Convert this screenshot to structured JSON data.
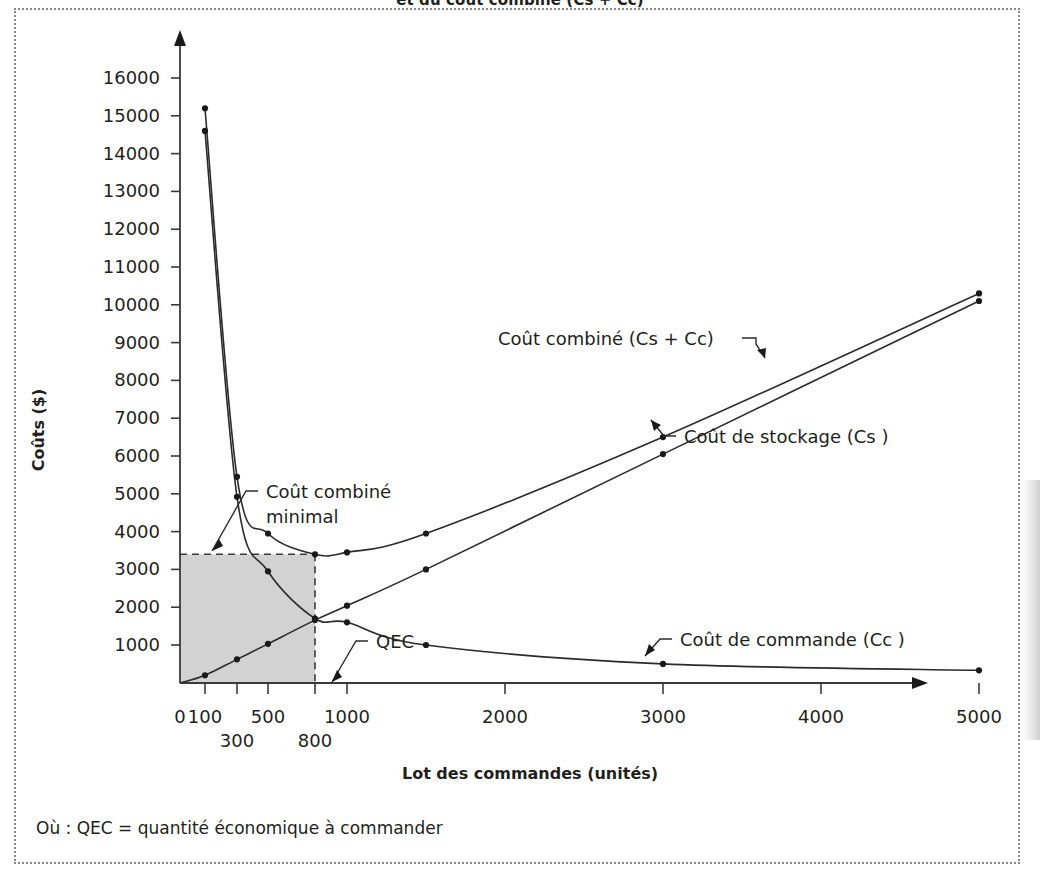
{
  "figure": {
    "title": "et du coût combiné (Cs + Cc)",
    "footnote": "Où : QEC = quantité économique à commander"
  },
  "chart_data": {
    "type": "line",
    "title": "et du coût combiné (Cs + Cc)",
    "xlabel": "Lot des commandes (unités)",
    "ylabel": "Coûts ($)",
    "xlim": [
      0,
      5300
    ],
    "ylim": [
      0,
      16800
    ],
    "grid": false,
    "legend_position": "inline-annotations",
    "xticks": [
      0,
      100,
      300,
      500,
      800,
      1000,
      2000,
      3000,
      4000,
      5000
    ],
    "xtick_labels": [
      "0",
      "100",
      "300",
      "500",
      "800",
      "1000",
      "2000",
      "3000",
      "4000",
      "5000"
    ],
    "xtick_labels_row2": [
      "300",
      "800"
    ],
    "yticks": [
      1000,
      2000,
      3000,
      4000,
      5000,
      6000,
      7000,
      8000,
      9000,
      10000,
      11000,
      12000,
      13000,
      14000,
      15000,
      16000
    ],
    "ytick_labels": [
      "1000",
      "2000",
      "3000",
      "4000",
      "5000",
      "6000",
      "7000",
      "8000",
      "9000",
      "10000",
      "11000",
      "12000",
      "13000",
      "14000",
      "15000",
      "16000"
    ],
    "x": [
      100,
      300,
      500,
      800,
      1000,
      1500,
      3000,
      5000
    ],
    "series": [
      {
        "name": "Coût combiné (Cs + Cc)",
        "values": [
          15200,
          5450,
          3950,
          3400,
          3450,
          3950,
          6500,
          10300
        ]
      },
      {
        "name": "Coût de stockage (Cs )",
        "values": [
          200,
          620,
          1030,
          1660,
          2040,
          3000,
          6050,
          10100
        ]
      },
      {
        "name": "Coût de commande (Cc )",
        "values": [
          14600,
          4920,
          2950,
          1700,
          1600,
          1000,
          500,
          330
        ]
      }
    ],
    "annotations": [
      {
        "key": "combined_min",
        "label_line1": "Coût combiné",
        "label_line2": "minimal",
        "value": 3400
      },
      {
        "key": "qec",
        "label": "QEC",
        "value": 800
      },
      {
        "key": "series_combined",
        "label": "Coût combiné (Cs + Cc)"
      },
      {
        "key": "series_storage",
        "label": "Coût de stockage (Cs )"
      },
      {
        "key": "series_ordering",
        "label": "Coût de commande (Cc )"
      }
    ],
    "shaded_region": {
      "label": "QEC x coût combiné minimal",
      "x_range": [
        0,
        800
      ],
      "y_range": [
        0,
        3400
      ],
      "color": "#d2d2d2"
    },
    "colors": {
      "curve": "#2b2b2b",
      "axis": "#3a3a3a",
      "shade": "#d2d2d2",
      "frame": "#8a8a8a"
    }
  }
}
